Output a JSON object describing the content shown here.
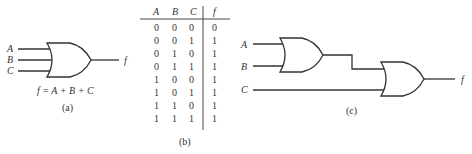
{
  "figure_a": {
    "inputs": [
      "A",
      "B",
      "C"
    ],
    "output": "f",
    "equation": "f = A + B + C",
    "caption": "(a)"
  },
  "figure_b": {
    "headers": [
      "A",
      "B",
      "C",
      "f"
    ],
    "rows": [
      [
        "0",
        "0",
        "0",
        "0"
      ],
      [
        "0",
        "0",
        "1",
        "1"
      ],
      [
        "0",
        "1",
        "0",
        "1"
      ],
      [
        "0",
        "1",
        "1",
        "1"
      ],
      [
        "1",
        "0",
        "0",
        "1"
      ],
      [
        "1",
        "0",
        "1",
        "1"
      ],
      [
        "1",
        "1",
        "0",
        "1"
      ],
      [
        "1",
        "1",
        "1",
        "1"
      ]
    ],
    "caption": "(b)"
  },
  "figure_c": {
    "inputs": [
      "A",
      "B",
      "C"
    ],
    "output": "f",
    "caption": "(c)"
  }
}
